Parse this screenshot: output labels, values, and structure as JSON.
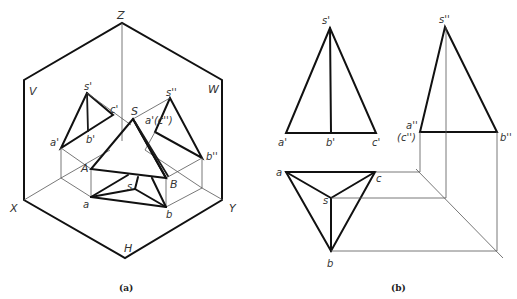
{
  "figure": {
    "panel_a": {
      "caption": "(a)",
      "axis_labels": {
        "z": "Z",
        "x": "X",
        "y": "Y",
        "h": "H",
        "v": "V",
        "w": "W"
      },
      "point_labels": {
        "s_prime": "s'",
        "a_prime": "a'",
        "b_prime": "b'",
        "c_prime": "c'",
        "s_dprime": "s''",
        "a_prime_c_dprime": "a'(c'')",
        "b_dprime": "b''",
        "S": "S",
        "A": "A",
        "B": "B",
        "a": "a",
        "b": "b",
        "s": "s"
      }
    },
    "panel_b": {
      "caption": "(b)",
      "front_view": {
        "s": "s'",
        "a": "a'",
        "b": "b'",
        "c": "c'"
      },
      "side_view": {
        "s": "s''",
        "a": "a''",
        "c": "(c'')",
        "b": "b''"
      },
      "top_view": {
        "a": "a",
        "c": "c",
        "s": "s",
        "b": "b"
      }
    }
  }
}
